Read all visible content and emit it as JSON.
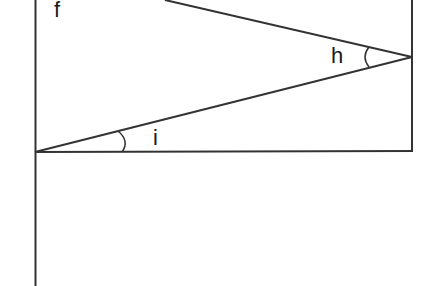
{
  "diagram": {
    "labels": {
      "f": "f",
      "h": "h",
      "i": "i"
    },
    "stroke_color": "#333333",
    "background": "#ffffff"
  }
}
